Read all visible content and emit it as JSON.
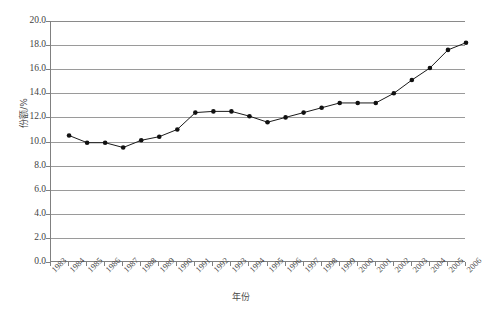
{
  "chart_data": {
    "type": "line",
    "title": "",
    "xlabel": "年份",
    "ylabel": "份额/%",
    "grid": true,
    "legend": "none",
    "xlim": [
      1983,
      2006
    ],
    "ylim": [
      0.0,
      20.0
    ],
    "ytick_step": 2.0,
    "x_tick_labels": [
      "1983",
      "1984",
      "1985",
      "1986",
      "1987",
      "1988",
      "1989",
      "1990",
      "1991",
      "1992",
      "1993",
      "1994",
      "1995",
      "1996",
      "1997",
      "1998",
      "1999",
      "2000",
      "2001",
      "2002",
      "2003",
      "2004",
      "2005",
      "2006"
    ],
    "y_tick_labels": [
      "0.0",
      "2.0",
      "4.0",
      "6.0",
      "8.0",
      "10.0",
      "12.0",
      "14.0",
      "16.0",
      "18.0",
      "20.0"
    ],
    "y_tick_values": [
      0.0,
      2.0,
      4.0,
      6.0,
      8.0,
      10.0,
      12.0,
      14.0,
      16.0,
      18.0,
      20.0
    ],
    "series": [
      {
        "name": "份额/%",
        "color": "#111111",
        "x": [
          1984,
          1985,
          1986,
          1987,
          1988,
          1989,
          1990,
          1991,
          1992,
          1993,
          1994,
          1995,
          1996,
          1997,
          1998,
          1999,
          2000,
          2001,
          2002,
          2003,
          2004,
          2005,
          2006
        ],
        "values": [
          10.5,
          9.9,
          9.9,
          9.5,
          10.1,
          10.4,
          11.0,
          12.4,
          12.5,
          12.5,
          12.1,
          11.6,
          12.0,
          12.4,
          12.8,
          13.2,
          13.2,
          13.2,
          14.0,
          15.1,
          16.1,
          17.6,
          18.2
        ]
      }
    ]
  }
}
